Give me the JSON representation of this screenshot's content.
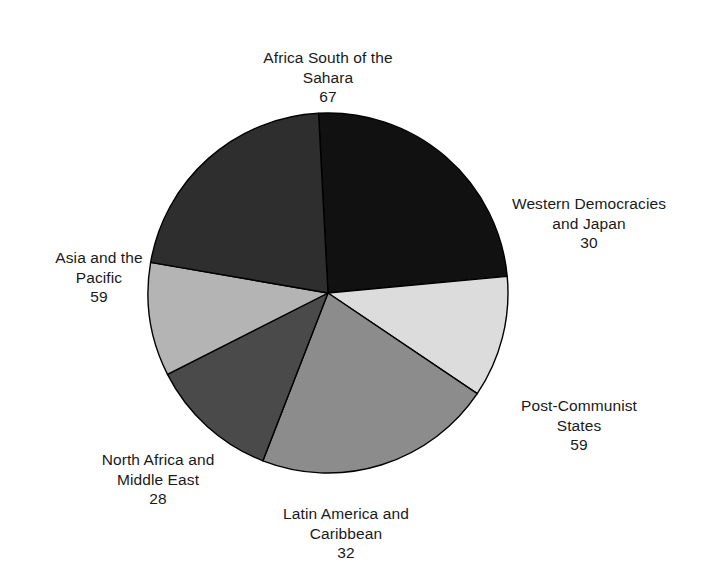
{
  "chart_data": {
    "type": "pie",
    "title": "",
    "subtitle": "",
    "xlabel": "",
    "ylabel": "",
    "legend_position": "outside-labels",
    "grid": false,
    "total": 275,
    "start_angle_deg": -3,
    "direction": "clockwise",
    "center": {
      "x": 328,
      "y": 293
    },
    "radius": 180,
    "categories": [
      "Africa South of the Sahara",
      "Western Democracies and Japan",
      "Post-Communist States",
      "Latin America and Caribbean",
      "North Africa and Middle East",
      "Asia and the Pacific"
    ],
    "values": [
      67,
      30,
      59,
      32,
      28,
      59
    ],
    "colors": [
      "#111111",
      "#dcdcdc",
      "#8c8c8c",
      "#4a4a4a",
      "#b4b4b4",
      "#2e2e2e"
    ],
    "slices": [
      {
        "name": "Africa South of the Sahara",
        "label_line1": "Africa South of the",
        "label_line2": "Sahara",
        "value": 67,
        "value_text": "67",
        "color": "#111111",
        "start_deg": -3,
        "sweep_deg": 87.7
      },
      {
        "name": "Western Democracies and Japan",
        "label_line1": "Western Democracies",
        "label_line2": "and Japan",
        "value": 30,
        "value_text": "30",
        "color": "#dcdcdc",
        "start_deg": 84.7,
        "sweep_deg": 39.3
      },
      {
        "name": "Post-Communist States",
        "label_line1": "Post-Communist",
        "label_line2": "States",
        "value": 59,
        "value_text": "59",
        "color": "#8c8c8c",
        "start_deg": 124.0,
        "sweep_deg": 77.2
      },
      {
        "name": "Latin America and Caribbean",
        "label_line1": "Latin America and",
        "label_line2": "Caribbean",
        "value": 32,
        "value_text": "32",
        "color": "#4a4a4a",
        "start_deg": 201.2,
        "sweep_deg": 41.9
      },
      {
        "name": "North Africa and Middle East",
        "label_line1": "North Africa and",
        "label_line2": "Middle East",
        "value": 28,
        "value_text": "28",
        "color": "#b4b4b4",
        "start_deg": 243.1,
        "sweep_deg": 36.7
      },
      {
        "name": "Asia and the Pacific",
        "label_line1": "Asia and the",
        "label_line2": "Pacific",
        "value": 59,
        "value_text": "59",
        "color": "#2e2e2e",
        "start_deg": 279.8,
        "sweep_deg": 77.2
      }
    ]
  },
  "labels": {
    "africa": {
      "line1": "Africa South of the",
      "line2": "Sahara",
      "value": "67"
    },
    "western": {
      "line1": "Western Democracies",
      "line2": "and Japan",
      "value": "30"
    },
    "postcommunist": {
      "line1": "Post-Communist",
      "line2": "States",
      "value": "59"
    },
    "latin": {
      "line1": "Latin America and",
      "line2": "Caribbean",
      "value": "32"
    },
    "northafrica": {
      "line1": "North Africa and",
      "line2": "Middle East",
      "value": "28"
    },
    "asia": {
      "line1": "Asia and the",
      "line2": "Pacific",
      "value": "59"
    }
  },
  "style": {
    "background": "#ffffff",
    "text_color": "#1a1a1a",
    "slice_outline": "#000000"
  }
}
